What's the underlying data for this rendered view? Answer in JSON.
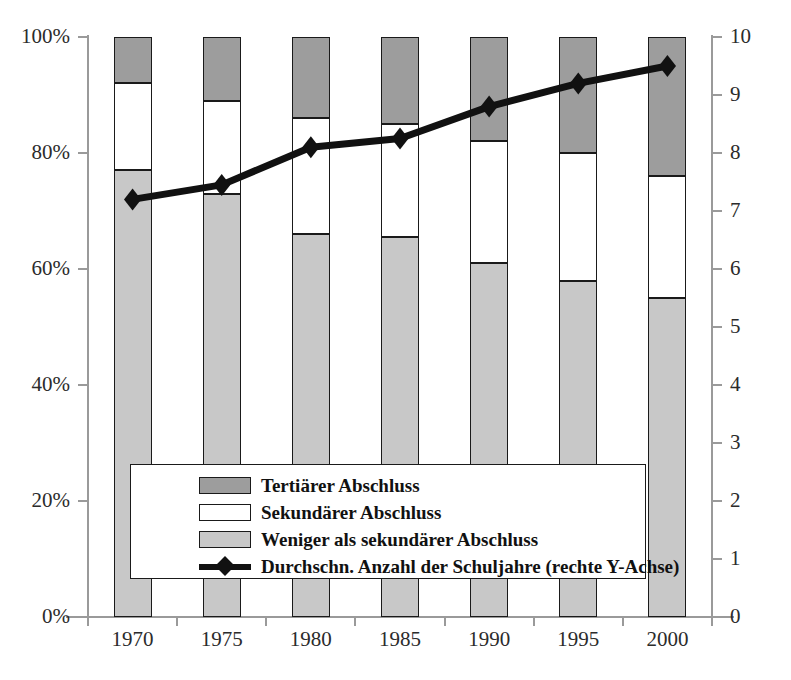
{
  "chart_data": {
    "type": "bar",
    "title": "",
    "subtitle": "",
    "xlabel": "",
    "ylabel": "",
    "categories": [
      "1970",
      "1975",
      "1980",
      "1985",
      "1990",
      "1995",
      "2000"
    ],
    "stacked": true,
    "ylim": [
      0,
      100
    ],
    "ytick_labels": [
      "0%",
      "20%",
      "40%",
      "60%",
      "80%",
      "100%"
    ],
    "ytick_values": [
      0,
      20,
      40,
      60,
      80,
      100
    ],
    "y2lim": [
      0,
      10
    ],
    "y2tick_labels": [
      "0",
      "1",
      "2",
      "3",
      "4",
      "5",
      "6",
      "7",
      "8",
      "9",
      "10"
    ],
    "y2tick_values": [
      0,
      1,
      2,
      3,
      4,
      5,
      6,
      7,
      8,
      9,
      10
    ],
    "grid": false,
    "legend_position": "inside-bottom-center",
    "series": [
      {
        "name": "Weniger als sekundärer Abschluss",
        "type": "bar",
        "axis": "left",
        "color": "#c8c8c8",
        "values": [
          77,
          73,
          66,
          65.5,
          61,
          58,
          55
        ]
      },
      {
        "name": "Sekundärer Abschluss",
        "type": "bar",
        "axis": "left",
        "color": "#ffffff",
        "values": [
          15,
          16,
          20,
          19.5,
          21,
          22,
          21
        ]
      },
      {
        "name": "Tertiärer Abschluss",
        "type": "bar",
        "axis": "left",
        "color": "#9d9d9d",
        "values": [
          8,
          11,
          14,
          15,
          18,
          20,
          24
        ]
      },
      {
        "name": "Durchschn. Anzahl der Schuljahre (rechte Y-Achse)",
        "type": "line",
        "axis": "right",
        "color": "#111111",
        "marker": "diamond",
        "values": [
          7.2,
          7.45,
          8.1,
          8.25,
          8.8,
          9.2,
          9.5
        ]
      }
    ],
    "stack_order_bottom_to_top": [
      "Weniger als sekundärer Abschluss",
      "Sekundärer Abschluss",
      "Tertiärer Abschluss"
    ]
  },
  "legend": {
    "items": [
      {
        "label": "Tertiärer Abschluss",
        "key": "swatch",
        "color": "#9d9d9d"
      },
      {
        "label": "Sekundärer Abschluss",
        "key": "swatch",
        "color": "#ffffff"
      },
      {
        "label": "Weniger als sekundärer Abschluss",
        "key": "swatch",
        "color": "#c8c8c8"
      },
      {
        "label": "Durchschn. Anzahl der Schuljahre (rechte Y-Achse)",
        "key": "line-marker",
        "color": "#111111"
      }
    ]
  },
  "colors": {
    "tertiary": "#9d9d9d",
    "secondary": "#ffffff",
    "less_than_secondary": "#c8c8c8",
    "line": "#111111",
    "axis": "#9a9a9a",
    "text": "#2b2b2b",
    "background": "#ffffff"
  }
}
